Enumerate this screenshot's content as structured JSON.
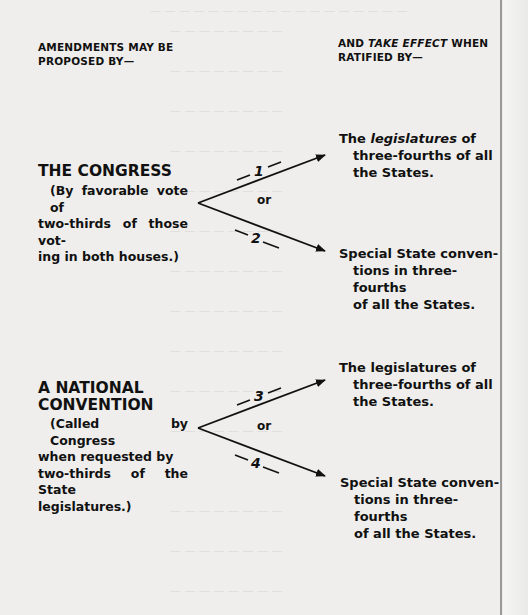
{
  "headers": {
    "proposed": {
      "line1": "AMENDMENTS MAY BE",
      "line2": "PROPOSED BY—"
    },
    "ratified": {
      "pre": "AND ",
      "italic": "TAKE EFFECT",
      "post": " WHEN",
      "line2": "RATIFIED BY—"
    }
  },
  "sources": [
    {
      "title_lines": [
        "THE CONGRESS"
      ],
      "description_lines": [
        "(By favorable vote of",
        "two-thirds of those vot-",
        "ing in both houses.)"
      ]
    },
    {
      "title_lines": [
        "A NATIONAL",
        "CONVENTION"
      ],
      "description_lines": [
        "(Called by Congress",
        "when requested by",
        "two-thirds of the State",
        "legislatures.)"
      ]
    }
  ],
  "destinations": {
    "legislatures_emphasized": {
      "pre": "The ",
      "italic": "legislatures",
      "post": " of",
      "lines": [
        "three-fourths of all",
        "the States."
      ]
    },
    "conventions_1": {
      "first": "Special State conven-",
      "lines": [
        "tions in three-fourths",
        "of all the States."
      ]
    },
    "legislatures_plain": {
      "first": "The legislatures of",
      "lines": [
        "three-fourths of all",
        "the States."
      ]
    },
    "conventions_2": {
      "first": "Special State conven-",
      "lines": [
        "tions in three-fourths",
        "of all the States."
      ]
    }
  },
  "connectors": {
    "or_label": "or",
    "method_numbers": [
      "1",
      "2",
      "3",
      "4"
    ]
  },
  "colors": {
    "ink": "#111111",
    "paper": "#efeeec",
    "bleed": "#d6d5d2"
  }
}
